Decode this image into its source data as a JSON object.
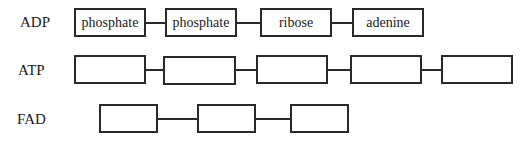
{
  "diagram": {
    "rows": [
      {
        "label": "ADP",
        "boxes": [
          "phosphate",
          "phosphate",
          "ribose",
          "adenine"
        ]
      },
      {
        "label": "ATP",
        "boxes": [
          "",
          "",
          "",
          "",
          ""
        ]
      },
      {
        "label": "FAD",
        "boxes": [
          "",
          "",
          ""
        ]
      }
    ]
  }
}
